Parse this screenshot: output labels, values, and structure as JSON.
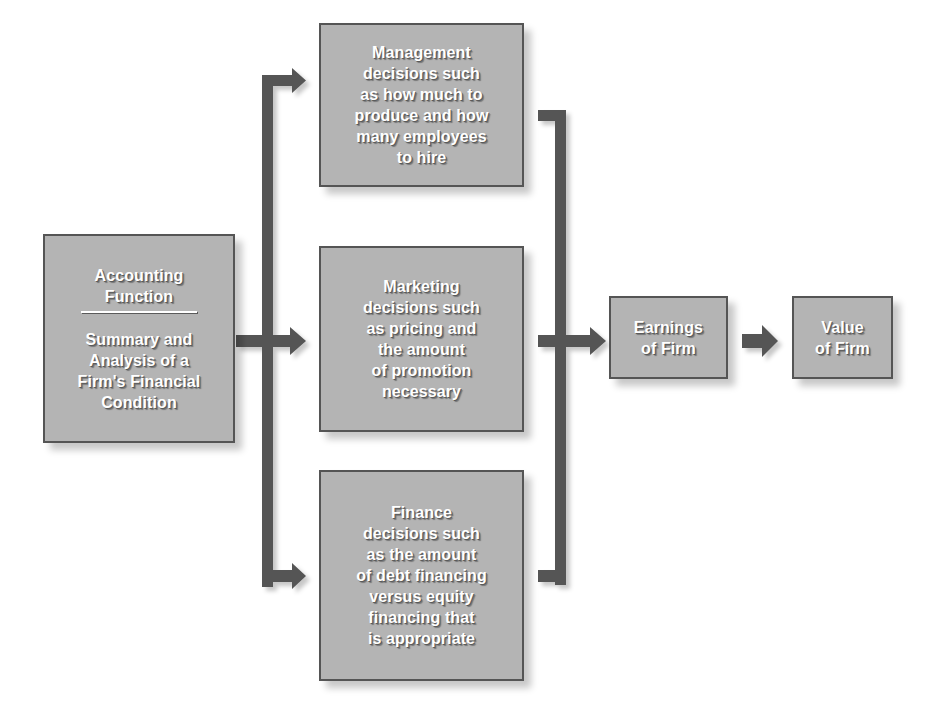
{
  "diagram": {
    "colors": {
      "box_fill": "#b4b4b4",
      "box_border": "#555555",
      "connector": "#555555",
      "text": "#ffffff"
    },
    "nodes": {
      "accounting": {
        "title_lines": [
          "Accounting",
          "Function"
        ],
        "body_lines": [
          "Summary and",
          "Analysis of a",
          "Firm's Financial",
          "Condition"
        ]
      },
      "management": {
        "lines": [
          "Management",
          "decisions such",
          "as how much to",
          "produce and how",
          "many employees",
          "to hire"
        ]
      },
      "marketing": {
        "lines": [
          "Marketing",
          "decisions such",
          "as pricing and",
          "the amount",
          "of promotion",
          "necessary"
        ]
      },
      "finance": {
        "lines": [
          "Finance",
          "decisions such",
          "as the amount",
          "of debt financing",
          "versus equity",
          "financing that",
          "is appropriate"
        ]
      },
      "earnings": {
        "lines": [
          "Earnings",
          "of Firm"
        ]
      },
      "value": {
        "lines": [
          "Value",
          "of Firm"
        ]
      }
    },
    "edges": [
      {
        "from": "accounting",
        "to": "management",
        "icon": "arrow-right-icon"
      },
      {
        "from": "accounting",
        "to": "marketing",
        "icon": "arrow-right-icon"
      },
      {
        "from": "accounting",
        "to": "finance",
        "icon": "arrow-right-icon"
      },
      {
        "from": "management",
        "to": "earnings",
        "icon": "arrow-right-icon"
      },
      {
        "from": "marketing",
        "to": "earnings",
        "icon": "arrow-right-icon"
      },
      {
        "from": "finance",
        "to": "earnings",
        "icon": "arrow-right-icon"
      },
      {
        "from": "earnings",
        "to": "value",
        "icon": "arrow-right-icon"
      }
    ]
  }
}
